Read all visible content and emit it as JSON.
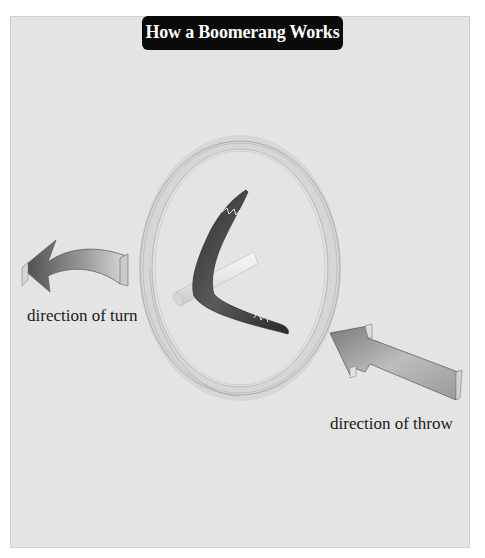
{
  "title": "How a Boomerang Works",
  "labels": {
    "direction_of_turn": "direction of turn",
    "direction_of_throw": "direction of throw"
  },
  "icons": {
    "turn_arrow": "curved-arrow-left-icon",
    "throw_arrow": "straight-arrow-up-left-icon",
    "boomerang": "boomerang-icon",
    "spin_ring": "rotation-ring-icon",
    "axis_rod": "spin-axis-icon"
  },
  "colors": {
    "panel_bg": "#e4e4e4",
    "title_bg": "#0a0a0a",
    "title_text": "#ffffff",
    "boomerang": "#3a3a3a",
    "label_text": "#1a1a1a"
  }
}
